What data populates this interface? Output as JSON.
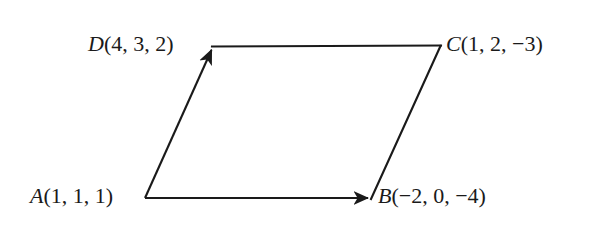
{
  "figure": {
    "type": "parallelogram-vector-diagram",
    "background_color": "#ffffff",
    "line_color": "#1a1a1a",
    "line_width": 2,
    "vertices": [
      {
        "id": "A",
        "name": "A",
        "coords_text": "(1, 1, 1)",
        "full_label": "A(1, 1, 1)",
        "coordinates": [
          1,
          1,
          1
        ],
        "x": 145,
        "y": 198,
        "label_position": "left",
        "has_arrowhead": false
      },
      {
        "id": "B",
        "name": "B",
        "coords_text": "(−2, 0, −4)",
        "full_label": "B(−2, 0, −4)",
        "coordinates": [
          -2,
          0,
          -4
        ],
        "x": 371,
        "y": 198,
        "label_position": "right",
        "has_arrowhead": true
      },
      {
        "id": "C",
        "name": "C",
        "coords_text": "(1, 2, −3)",
        "full_label": "C(1, 2, −3)",
        "coordinates": [
          1,
          2,
          -3
        ],
        "x": 440,
        "y": 46,
        "label_position": "right",
        "has_arrowhead": false
      },
      {
        "id": "D",
        "name": "D",
        "coords_text": "(4, 3, 2)",
        "full_label": "D(4, 3, 2)",
        "coordinates": [
          4,
          3,
          2
        ],
        "x": 213,
        "y": 47,
        "label_position": "left",
        "has_arrowhead": true
      }
    ],
    "edges": [
      {
        "id": "AB",
        "from": "A",
        "to": "B",
        "arrow": true,
        "description": "vector from A to B"
      },
      {
        "id": "AD",
        "from": "A",
        "to": "D",
        "arrow": true,
        "description": "vector from A to D"
      },
      {
        "id": "DC",
        "from": "D",
        "to": "C",
        "arrow": false,
        "description": "top side from D to C"
      },
      {
        "id": "BC",
        "from": "B",
        "to": "C",
        "arrow": false,
        "description": "right side from B to C"
      }
    ]
  }
}
